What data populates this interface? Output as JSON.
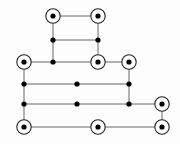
{
  "figure": {
    "title": "",
    "background_color": "#fdfdfd",
    "width": 180,
    "height": 144
  },
  "style": {
    "edge_color": "#555555",
    "edge_width": 0.9,
    "solid_node_color": "#000000",
    "solid_node_radius": 2.6,
    "ring_outer_radius": 7.2,
    "ring_outer_stroke": "#222222",
    "ring_outer_stroke_width": 1.1,
    "ring_inner_radius": 2.6,
    "ring_inner_color": "#000000",
    "ring_fill": "#ffffff"
  },
  "chart_data": {
    "type": "diagram",
    "subtype": "node-link-graph",
    "title": "",
    "xlabel": "",
    "ylabel": "",
    "node_kinds": [
      "ring",
      "dot"
    ],
    "nodes": [
      {
        "id": "n1",
        "x": 53,
        "y": 16,
        "kind": "ring",
        "label": ""
      },
      {
        "id": "n2",
        "x": 98,
        "y": 16,
        "kind": "ring",
        "label": ""
      },
      {
        "id": "n3",
        "x": 53,
        "y": 40,
        "kind": "dot",
        "label": ""
      },
      {
        "id": "n4",
        "x": 98,
        "y": 40,
        "kind": "dot",
        "label": ""
      },
      {
        "id": "n5",
        "x": 24,
        "y": 62,
        "kind": "ring",
        "label": ""
      },
      {
        "id": "n6",
        "x": 53,
        "y": 62,
        "kind": "dot",
        "label": ""
      },
      {
        "id": "n7",
        "x": 98,
        "y": 62,
        "kind": "ring",
        "label": ""
      },
      {
        "id": "n8",
        "x": 129,
        "y": 62,
        "kind": "ring",
        "label": ""
      },
      {
        "id": "n9",
        "x": 24,
        "y": 84,
        "kind": "dot",
        "label": ""
      },
      {
        "id": "n10",
        "x": 77,
        "y": 84,
        "kind": "dot",
        "label": ""
      },
      {
        "id": "n11",
        "x": 129,
        "y": 84,
        "kind": "dot",
        "label": ""
      },
      {
        "id": "n12",
        "x": 24,
        "y": 104,
        "kind": "dot",
        "label": ""
      },
      {
        "id": "n13",
        "x": 77,
        "y": 104,
        "kind": "dot",
        "label": ""
      },
      {
        "id": "n14",
        "x": 129,
        "y": 104,
        "kind": "dot",
        "label": ""
      },
      {
        "id": "n15",
        "x": 162,
        "y": 104,
        "kind": "ring",
        "label": ""
      },
      {
        "id": "n16",
        "x": 24,
        "y": 127,
        "kind": "ring",
        "label": ""
      },
      {
        "id": "n17",
        "x": 98,
        "y": 127,
        "kind": "ring",
        "label": ""
      },
      {
        "id": "n18",
        "x": 162,
        "y": 127,
        "kind": "ring",
        "label": ""
      }
    ],
    "edges": [
      {
        "source": "n1",
        "target": "n2"
      },
      {
        "source": "n1",
        "target": "n3"
      },
      {
        "source": "n2",
        "target": "n4"
      },
      {
        "source": "n3",
        "target": "n4"
      },
      {
        "source": "n3",
        "target": "n6"
      },
      {
        "source": "n4",
        "target": "n7"
      },
      {
        "source": "n5",
        "target": "n6"
      },
      {
        "source": "n6",
        "target": "n7"
      },
      {
        "source": "n7",
        "target": "n8"
      },
      {
        "source": "n5",
        "target": "n9"
      },
      {
        "source": "n8",
        "target": "n11"
      },
      {
        "source": "n9",
        "target": "n10"
      },
      {
        "source": "n10",
        "target": "n11"
      },
      {
        "source": "n9",
        "target": "n12"
      },
      {
        "source": "n11",
        "target": "n14"
      },
      {
        "source": "n12",
        "target": "n13"
      },
      {
        "source": "n13",
        "target": "n14"
      },
      {
        "source": "n14",
        "target": "n15"
      },
      {
        "source": "n12",
        "target": "n16"
      },
      {
        "source": "n15",
        "target": "n18"
      },
      {
        "source": "n16",
        "target": "n17"
      },
      {
        "source": "n17",
        "target": "n18"
      }
    ]
  }
}
